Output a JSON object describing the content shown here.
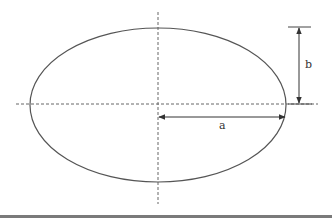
{
  "diagram": {
    "shape": "ellipse",
    "labels": {
      "semi_major": "a",
      "semi_minor": "b"
    },
    "colors": {
      "stroke": "#555555",
      "dashed": "#666666",
      "text": "#333333",
      "bottom_rule": "#7a7a7a"
    }
  }
}
